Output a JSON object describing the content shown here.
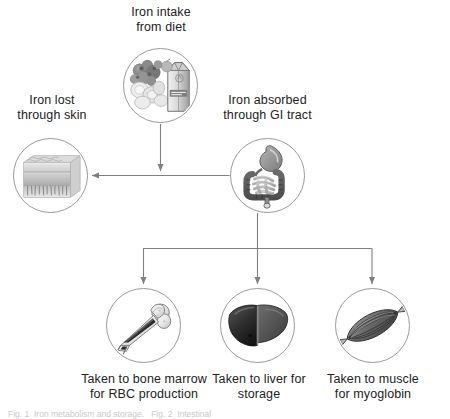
{
  "diagram": {
    "type": "flowchart",
    "colors": {
      "arrow": "#808080",
      "outline": "#9a9a9a",
      "text": "#222222",
      "background": "#ffffff"
    },
    "nodes": [
      {
        "id": "diet",
        "label": "Iron intake\nfrom diet",
        "icon": "food-plate-and-milk-carton-icon",
        "label_position": "above"
      },
      {
        "id": "skin",
        "label": "Iron lost\nthrough skin",
        "icon": "skin-cross-section-icon",
        "label_position": "above"
      },
      {
        "id": "gi",
        "label": "Iron absorbed\nthrough GI tract",
        "icon": "stomach-and-intestines-icon",
        "label_position": "above"
      },
      {
        "id": "marrow",
        "label": "Taken to bone marrow\nfor RBC production",
        "icon": "femur-bone-marrow-icon",
        "label_position": "below"
      },
      {
        "id": "liver",
        "label": "Taken to liver for\nstorage",
        "icon": "liver-icon",
        "label_position": "below"
      },
      {
        "id": "muscle",
        "label": "Taken to muscle\nfor myoglobin",
        "icon": "skeletal-muscle-icon",
        "label_position": "below"
      }
    ],
    "edges": [
      {
        "from": "diet",
        "to": "junction",
        "style": "single-arrow-down"
      },
      {
        "from": "gi",
        "to": "skin",
        "style": "double-headed-arrow-horizontal"
      },
      {
        "from": "gi",
        "to": "marrow",
        "style": "single-arrow-down"
      },
      {
        "from": "gi",
        "to": "liver",
        "style": "single-arrow-down"
      },
      {
        "from": "gi",
        "to": "muscle",
        "style": "single-arrow-down"
      }
    ]
  },
  "caption": {
    "text": "Fig. 1  Iron metabolism and storage.   Fig. 2  Intestinal"
  }
}
